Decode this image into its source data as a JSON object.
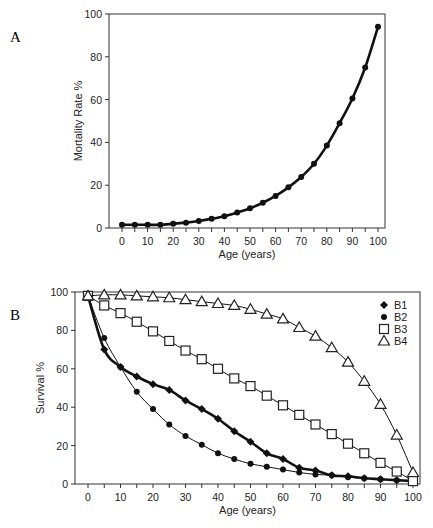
{
  "chart_data": [
    {
      "panel": "A",
      "type": "line",
      "title": "",
      "xlabel": "Age (years)",
      "ylabel": "Mortality Rate %",
      "xlim": [
        0,
        100
      ],
      "ylim": [
        0,
        100
      ],
      "xticks": [
        0,
        10,
        20,
        30,
        40,
        50,
        60,
        70,
        80,
        90,
        100
      ],
      "yticks": [
        0,
        20,
        40,
        60,
        80,
        100
      ],
      "grid": false,
      "legend": null,
      "series": [
        {
          "name": "Mortality",
          "marker": "circle",
          "x": [
            0,
            5,
            10,
            15,
            20,
            25,
            30,
            35,
            40,
            45,
            50,
            55,
            60,
            65,
            70,
            75,
            80,
            85,
            90,
            95,
            100
          ],
          "values": [
            1.5,
            1.5,
            1.5,
            1.5,
            2,
            2.5,
            3.3,
            4.3,
            5.5,
            7.2,
            9.2,
            11.8,
            15,
            19,
            23.8,
            30,
            38.5,
            49,
            60.5,
            75,
            94
          ]
        }
      ]
    },
    {
      "panel": "B",
      "type": "line",
      "title": "",
      "xlabel": "Age (years)",
      "ylabel": "Survival  %",
      "xlim": [
        0,
        100
      ],
      "ylim": [
        0,
        100
      ],
      "xticks": [
        0,
        10,
        20,
        30,
        40,
        50,
        60,
        70,
        80,
        90,
        100
      ],
      "yticks": [
        0,
        20,
        40,
        60,
        80,
        100
      ],
      "grid": false,
      "legend_position": "upper right",
      "series": [
        {
          "name": "B1",
          "marker": "diamond",
          "x": [
            0,
            5,
            10,
            15,
            20,
            25,
            30,
            35,
            40,
            45,
            50,
            55,
            60,
            65,
            70,
            75,
            80,
            85,
            90,
            95,
            100
          ],
          "values": [
            98,
            70,
            61,
            56,
            52,
            49,
            43.5,
            39,
            34,
            27.5,
            22,
            16,
            13,
            8.5,
            7,
            4.5,
            4,
            3,
            2.5,
            2,
            1.5
          ]
        },
        {
          "name": "B2",
          "marker": "circle",
          "x": [
            0,
            5,
            10,
            15,
            20,
            25,
            30,
            35,
            40,
            45,
            50,
            55,
            60,
            65,
            70,
            75,
            80,
            85,
            90,
            95,
            100
          ],
          "values": [
            98,
            76,
            61,
            48,
            39,
            31,
            25,
            20.5,
            16,
            13,
            10.5,
            9,
            7.5,
            6,
            5,
            4.5,
            3.5,
            3,
            2.5,
            2,
            1.5
          ]
        },
        {
          "name": "B3",
          "marker": "square-open",
          "x": [
            0,
            5,
            10,
            15,
            20,
            25,
            30,
            35,
            40,
            45,
            50,
            55,
            60,
            65,
            70,
            75,
            80,
            85,
            90,
            95,
            100
          ],
          "values": [
            98,
            93,
            89,
            84.5,
            79.5,
            74.5,
            69.5,
            65,
            60,
            55,
            51,
            46,
            41,
            36,
            31,
            26,
            21,
            16,
            11,
            6.5,
            1.5
          ]
        },
        {
          "name": "B4",
          "marker": "triangle-open",
          "x": [
            0,
            5,
            10,
            15,
            20,
            25,
            30,
            35,
            40,
            45,
            50,
            55,
            60,
            65,
            70,
            75,
            80,
            85,
            90,
            95,
            100
          ],
          "values": [
            98,
            98.5,
            98.5,
            98,
            97.5,
            97,
            96,
            95,
            94,
            93,
            91,
            88.5,
            86,
            81.5,
            77,
            71,
            63.5,
            53.5,
            41.5,
            25.5,
            6
          ]
        }
      ]
    }
  ],
  "labels": {
    "panel_a": "A",
    "panel_b": "B"
  }
}
